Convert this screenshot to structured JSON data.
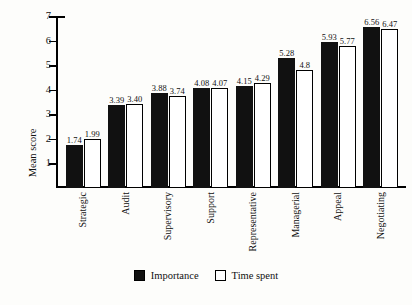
{
  "chart_data": {
    "type": "bar",
    "title": "",
    "subtitle": "",
    "xlabel": "",
    "ylabel": "Mean score",
    "ylim": [
      0,
      7
    ],
    "yticks": [
      1,
      2,
      3,
      4,
      5,
      6,
      7
    ],
    "grid": false,
    "legend_position": "bottom",
    "categories": [
      "Strategic",
      "Audit",
      "Supervisory",
      "Support",
      "Representative",
      "Managerial",
      "Appeal",
      "Negotiating"
    ],
    "series": [
      {
        "name": "Importance",
        "color": "#111111",
        "style": "filled",
        "values": [
          1.74,
          3.39,
          3.88,
          4.08,
          4.15,
          5.28,
          5.93,
          6.56
        ],
        "labels": [
          "1.74",
          "3.39",
          "3.88",
          "4.08",
          "4.15",
          "5.28",
          "5.93",
          "6.56"
        ]
      },
      {
        "name": "Time spent",
        "color": "#ffffff",
        "style": "hollow",
        "values": [
          1.99,
          3.4,
          3.74,
          4.07,
          4.29,
          4.8,
          5.77,
          6.47
        ],
        "labels": [
          "1.99",
          "3.40",
          "3.74",
          "4.07",
          "4.29",
          "4.8",
          "5.77",
          "6.47"
        ]
      }
    ]
  },
  "axis": {
    "y_title": "Mean score",
    "tick_labels": [
      "7",
      "6",
      "5",
      "4",
      "3",
      "2",
      "1"
    ]
  },
  "legend": {
    "items": [
      {
        "label": "Importance",
        "swatch": "filled-square-icon"
      },
      {
        "label": "Time spent",
        "swatch": "hollow-square-icon"
      }
    ]
  },
  "colors": {
    "bar_importance": "#111111",
    "bar_time_spent": "#ffffff",
    "axis": "#000000",
    "background": "#fdfdfb",
    "text": "#111111"
  }
}
